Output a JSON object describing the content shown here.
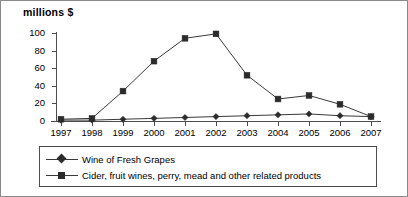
{
  "chart_data": {
    "type": "line",
    "title": "millions $",
    "xlabel": "",
    "ylabel": "millions $",
    "categories": [
      "1997",
      "1998",
      "1999",
      "2000",
      "2001",
      "2002",
      "2003",
      "2004",
      "2005",
      "2006",
      "2007"
    ],
    "series": [
      {
        "name": "Wine of Fresh Grapes",
        "marker": "diamond",
        "values": [
          1,
          1,
          2,
          3,
          4,
          5,
          6,
          7,
          8,
          6,
          5
        ]
      },
      {
        "name": "Cider, fruit wines, perry, mead and other related products",
        "marker": "square",
        "values": [
          2,
          3,
          34,
          68,
          94,
          99,
          52,
          25,
          29,
          19,
          5
        ]
      }
    ],
    "ylim": [
      0,
      100
    ],
    "yticks": [
      0,
      20,
      40,
      60,
      80,
      100
    ],
    "ytick_labels": [
      "0",
      "20",
      "40",
      "60",
      "80",
      "100"
    ],
    "grid": false,
    "legend_position": "bottom",
    "legend_entries": [
      "Wine of Fresh Grapes",
      "Cider, fruit wines, perry, mead and other related products"
    ],
    "colors": {
      "line": "#3a3a3a",
      "marker": "#2b2b2b",
      "axis": "#4d4d4d",
      "text": "#000000",
      "background": "#ffffff",
      "border": "#8a8a8a"
    }
  }
}
